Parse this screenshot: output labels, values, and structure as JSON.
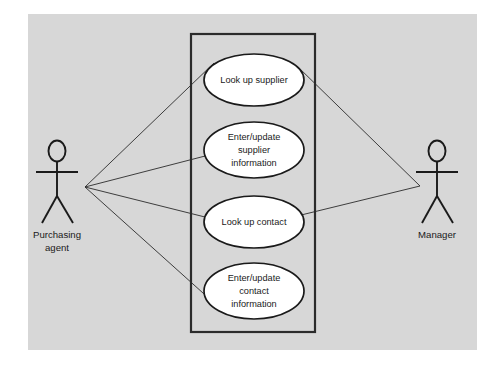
{
  "diagram": {
    "type": "uml-use-case-diagram",
    "canvas": {
      "background_color": "#d7d7d7",
      "page_color": "#ffffff"
    },
    "system_boundary": {
      "label": "",
      "stroke_color": "#2b2b2b"
    },
    "actors": [
      {
        "id": "purchasing-agent",
        "label_line1": "Purchasing",
        "label_line2": "agent",
        "side": "left"
      },
      {
        "id": "manager",
        "label_line1": "Manager",
        "label_line2": "",
        "side": "right"
      }
    ],
    "use_cases": [
      {
        "id": "look-up-supplier",
        "line1": "Look up supplier",
        "line2": "",
        "line3": ""
      },
      {
        "id": "enter-update-supplier-information",
        "line1": "Enter/update",
        "line2": "supplier",
        "line3": "information"
      },
      {
        "id": "look-up-contact",
        "line1": "Look up contact",
        "line2": "",
        "line3": ""
      },
      {
        "id": "enter-update-contact-information",
        "line1": "Enter/update",
        "line2": "contact",
        "line3": "information"
      }
    ],
    "associations": [
      {
        "actor": "purchasing-agent",
        "use_case": "look-up-supplier"
      },
      {
        "actor": "purchasing-agent",
        "use_case": "enter-update-supplier-information"
      },
      {
        "actor": "purchasing-agent",
        "use_case": "look-up-contact"
      },
      {
        "actor": "purchasing-agent",
        "use_case": "enter-update-contact-information"
      },
      {
        "actor": "manager",
        "use_case": "look-up-supplier"
      },
      {
        "actor": "manager",
        "use_case": "look-up-contact"
      }
    ]
  }
}
